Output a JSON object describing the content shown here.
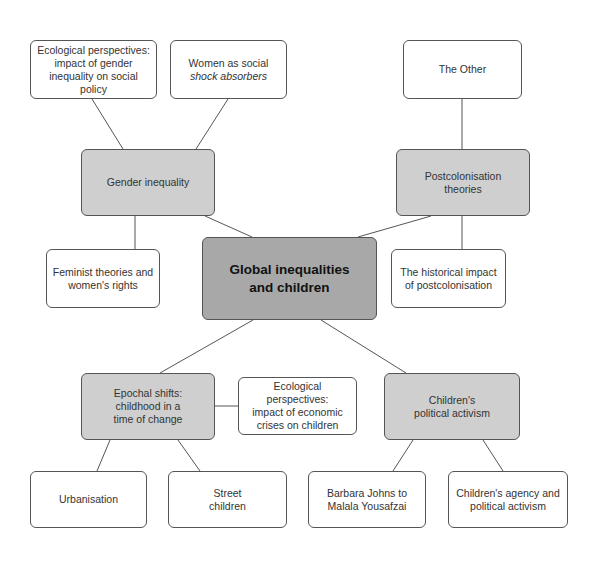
{
  "central": {
    "line1": "Global inequalities",
    "line2": "and children"
  },
  "branches": {
    "gender": {
      "label": "Gender inequality"
    },
    "postcolonisation": {
      "line1": "Postcolonisation",
      "line2": "theories"
    },
    "epochal": {
      "line1": "Epochal shifts:",
      "line2": "childhood in a",
      "line3": "time of change"
    },
    "activism": {
      "line1": "Children's",
      "line2": "political activism"
    }
  },
  "leaves": {
    "ecological_gender": {
      "line1": "Ecological perspectives:",
      "line2": "impact of gender",
      "line3": "inequality on social policy"
    },
    "women_shock": {
      "line1": "Women as social",
      "line2": "shock absorbers"
    },
    "feminist": {
      "line1": "Feminist theories and",
      "line2": "women's rights"
    },
    "the_other": {
      "label": "The Other"
    },
    "historical": {
      "line1": "The historical impact",
      "line2": "of postcolonisation"
    },
    "ecological_economic": {
      "line1": "Ecological perspectives:",
      "line2": "impact of economic",
      "line3": "crises on children"
    },
    "urbanisation": {
      "label": "Urbanisation"
    },
    "street_children": {
      "line1": "Street",
      "line2": "children"
    },
    "barbara": {
      "line1": "Barbara Johns to",
      "line2": "Malala Yousafzai"
    },
    "agency": {
      "line1": "Children's agency and",
      "line2": "political activism"
    }
  },
  "colors": {
    "central_fill": "#a8a8a8",
    "branch_fill": "#cfcfcf",
    "leaf_fill": "#ffffff",
    "border": "#555555"
  }
}
